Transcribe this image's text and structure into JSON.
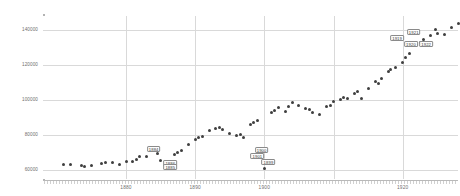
{
  "chart_data": {
    "type": "scatter",
    "title": "",
    "xlabel": "",
    "ylabel": "",
    "xlim": [
      1868,
      1928
    ],
    "ylim": [
      55000,
      148000
    ],
    "grid": true,
    "legend": false,
    "y_ticks": [
      "140000",
      "120000",
      "100000",
      "80000",
      "60000"
    ],
    "y_tick_values": [
      140000,
      120000,
      100000,
      80000,
      60000
    ],
    "x_ticks": [
      "1880",
      "1890",
      "1900",
      "1920"
    ],
    "x_tick_values": [
      1880,
      1890,
      1900,
      1920
    ],
    "marker_color": "#3f3f3f",
    "grid_color": "#d9d9d9",
    "axis_color": "#b3b3b3",
    "points": [
      {
        "x": 1871,
        "y": 63500
      },
      {
        "x": 1872,
        "y": 63200
      },
      {
        "x": 1874,
        "y": 62400
      },
      {
        "x": 1875,
        "y": 62600
      },
      {
        "x": 1877,
        "y": 64600
      },
      {
        "x": 1878,
        "y": 64300
      },
      {
        "x": 1879,
        "y": 63100
      },
      {
        "x": 1880,
        "y": 64900
      },
      {
        "x": 1881,
        "y": 65100
      },
      {
        "x": 1882,
        "y": 67900
      },
      {
        "x": 1883,
        "y": 68100
      },
      {
        "x": 1884,
        "y": 71900
      },
      {
        "x": 1885,
        "y": 65300
      },
      {
        "x": 1886,
        "y": 64100
      },
      {
        "x": 1887,
        "y": 68700
      },
      {
        "x": 1888,
        "y": 71300
      },
      {
        "x": 1889,
        "y": 74900
      },
      {
        "x": 1890,
        "y": 77800
      },
      {
        "x": 1891,
        "y": 79500
      },
      {
        "x": 1892,
        "y": 82600
      },
      {
        "x": 1893,
        "y": 83900
      },
      {
        "x": 1894,
        "y": 83100
      },
      {
        "x": 1895,
        "y": 81200
      },
      {
        "x": 1896,
        "y": 79700
      },
      {
        "x": 1897,
        "y": 78400
      },
      {
        "x": 1898,
        "y": 85900
      },
      {
        "x": 1899,
        "y": 88200
      },
      {
        "x": 1900,
        "y": 60800
      },
      {
        "x": 1901,
        "y": 92700
      },
      {
        "x": 1902,
        "y": 95600
      },
      {
        "x": 1903,
        "y": 93400
      },
      {
        "x": 1904,
        "y": 98400
      },
      {
        "x": 1905,
        "y": 96900
      },
      {
        "x": 1906,
        "y": 95200
      },
      {
        "x": 1907,
        "y": 93100
      },
      {
        "x": 1908,
        "y": 91700
      },
      {
        "x": 1909,
        "y": 96400
      },
      {
        "x": 1910,
        "y": 99300
      },
      {
        "x": 1911,
        "y": 100600
      },
      {
        "x": 1912,
        "y": 100900
      },
      {
        "x": 1913,
        "y": 103600
      },
      {
        "x": 1914,
        "y": 100800
      },
      {
        "x": 1915,
        "y": 106900
      },
      {
        "x": 1916,
        "y": 110800
      },
      {
        "x": 1917,
        "y": 112100
      },
      {
        "x": 1918,
        "y": 116400
      },
      {
        "x": 1919,
        "y": 118900
      },
      {
        "x": 1920,
        "y": 121600
      },
      {
        "x": 1921,
        "y": 126800
      },
      {
        "x": 1922,
        "y": 131700
      },
      {
        "x": 1923,
        "y": 134600
      },
      {
        "x": 1924,
        "y": 136900
      },
      {
        "x": 1925,
        "y": 138100
      },
      {
        "x": 1926,
        "y": 137400
      },
      {
        "x": 1927,
        "y": 141200
      },
      {
        "x": 1928,
        "y": 143800
      },
      {
        "x": 1924.8,
        "y": 140400
      },
      {
        "x": 1922.6,
        "y": 133100
      },
      {
        "x": 1920.4,
        "y": 124300
      },
      {
        "x": 1918.2,
        "y": 117200
      },
      {
        "x": 1916.5,
        "y": 109600
      },
      {
        "x": 1913.5,
        "y": 104700
      },
      {
        "x": 1911.5,
        "y": 101300
      },
      {
        "x": 1909.5,
        "y": 97200
      },
      {
        "x": 1906.5,
        "y": 94600
      },
      {
        "x": 1903.5,
        "y": 96200
      },
      {
        "x": 1901.5,
        "y": 94100
      },
      {
        "x": 1898.5,
        "y": 87300
      },
      {
        "x": 1896.5,
        "y": 80300
      },
      {
        "x": 1893.5,
        "y": 84400
      },
      {
        "x": 1890.5,
        "y": 78900
      },
      {
        "x": 1887.5,
        "y": 70200
      },
      {
        "x": 1884.5,
        "y": 69400
      },
      {
        "x": 1881.5,
        "y": 66200
      },
      {
        "x": 1876.5,
        "y": 63800
      },
      {
        "x": 1873.5,
        "y": 62900
      }
    ],
    "annotations": [
      {
        "label": "1884",
        "x": 1884,
        "y": 71900
      },
      {
        "label": "1886",
        "x": 1886.4,
        "y": 64100
      },
      {
        "label": "1885",
        "x": 1886.4,
        "y": 61600
      },
      {
        "label": "1900",
        "x": 1899.6,
        "y": 71400
      },
      {
        "label": "1901",
        "x": 1899.0,
        "y": 68100
      },
      {
        "label": "1899",
        "x": 1900.6,
        "y": 64900
      },
      {
        "label": "1921",
        "x": 1921.6,
        "y": 138600
      },
      {
        "label": "1919",
        "x": 1919.2,
        "y": 135400
      },
      {
        "label": "1920",
        "x": 1921.2,
        "y": 131900
      },
      {
        "label": "1922",
        "x": 1923.4,
        "y": 131900
      }
    ]
  }
}
